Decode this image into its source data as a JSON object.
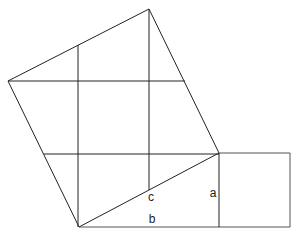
{
  "diagram": {
    "type": "geometry",
    "colors": {
      "line": "#222222",
      "background": "#ffffff"
    },
    "labels": {
      "a": "a",
      "b": "b",
      "c": "c"
    },
    "points": {
      "bottom": [
        79,
        227
      ],
      "right": [
        219,
        153
      ],
      "top": [
        149,
        9
      ],
      "left": [
        8,
        81
      ],
      "square_a_top_right": [
        290,
        153
      ],
      "square_a_bottom_right": [
        290,
        227
      ]
    },
    "label_positions": {
      "a": [
        213,
        197
      ],
      "b": [
        152,
        223
      ],
      "c": [
        151,
        201
      ]
    }
  }
}
